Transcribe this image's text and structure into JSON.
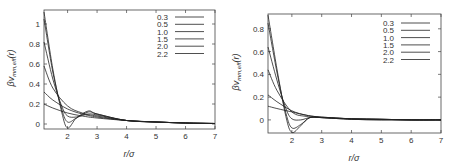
{
  "chart_data": [
    {
      "type": "line",
      "panel": "left",
      "title": "",
      "xlabel": "r/σ",
      "ylabel": "βv_mm,eff(r)",
      "xlim": [
        1.2,
        7
      ],
      "ylim": [
        -0.05,
        1.14
      ],
      "xticks": [
        2,
        3,
        4,
        5,
        6,
        7
      ],
      "yticks": [
        0,
        0.2,
        0.4,
        0.6,
        0.8,
        1
      ],
      "ytick_labels": [
        "0",
        "0.2",
        "0.4",
        "0.6",
        "0.8",
        "1"
      ],
      "grid": false,
      "legend_position": "upper right",
      "series": [
        {
          "name": "0.3",
          "x": [
            1.2,
            1.5,
            2.0,
            2.5,
            3.0,
            4.0,
            5.0,
            6.0,
            7.0
          ],
          "values": [
            0.2,
            0.16,
            0.11,
            0.08,
            0.06,
            0.035,
            0.02,
            0.01,
            0.005
          ]
        },
        {
          "name": "0.5",
          "x": [
            1.2,
            1.5,
            2.0,
            2.5,
            3.0,
            4.0,
            5.0,
            6.0,
            7.0
          ],
          "values": [
            0.32,
            0.24,
            0.15,
            0.1,
            0.07,
            0.035,
            0.02,
            0.01,
            0.005
          ]
        },
        {
          "name": "1.0",
          "x": [
            1.2,
            1.5,
            2.0,
            2.5,
            3.0,
            4.0,
            5.0,
            6.0,
            7.0
          ],
          "values": [
            0.58,
            0.36,
            0.18,
            0.11,
            0.08,
            0.035,
            0.02,
            0.01,
            0.005
          ]
        },
        {
          "name": "1.5",
          "x": [
            1.2,
            1.5,
            1.8,
            2.0,
            2.3,
            2.7,
            3.0,
            4.0,
            5.0,
            6.0,
            7.0
          ],
          "values": [
            0.82,
            0.45,
            0.18,
            0.08,
            0.07,
            0.1,
            0.09,
            0.035,
            0.02,
            0.01,
            0.005
          ]
        },
        {
          "name": "2.0",
          "x": [
            1.2,
            1.5,
            1.8,
            2.0,
            2.3,
            2.7,
            3.0,
            4.0,
            5.0,
            6.0,
            7.0
          ],
          "values": [
            1.05,
            0.52,
            0.15,
            0.02,
            0.06,
            0.12,
            0.1,
            0.035,
            0.02,
            0.01,
            0.005
          ]
        },
        {
          "name": "2.2",
          "x": [
            1.2,
            1.5,
            1.8,
            2.0,
            2.3,
            2.7,
            3.0,
            4.0,
            5.0,
            6.0,
            7.0
          ],
          "values": [
            1.12,
            0.55,
            0.12,
            -0.04,
            0.06,
            0.13,
            0.1,
            0.035,
            0.02,
            0.01,
            0.005
          ]
        }
      ]
    },
    {
      "type": "line",
      "panel": "right",
      "title": "",
      "xlabel": "r/σ",
      "ylabel": "βv_mm,eff(r)",
      "xlim": [
        1.2,
        7
      ],
      "ylim": [
        -0.115,
        0.93
      ],
      "xticks": [
        2,
        3,
        4,
        5,
        6,
        7
      ],
      "yticks": [
        0,
        0.2,
        0.4,
        0.6,
        0.8
      ],
      "ytick_labels": [
        "0",
        "0.2",
        "0.4",
        "0.6",
        "0.8"
      ],
      "grid": false,
      "legend_position": "upper right",
      "series": [
        {
          "name": "0.3",
          "x": [
            1.2,
            1.5,
            2.0,
            2.5,
            3.0,
            4.0,
            5.0,
            6.0,
            7.0
          ],
          "values": [
            0.12,
            0.1,
            0.07,
            0.04,
            0.025,
            0.01,
            0.005,
            0.0,
            0.0
          ]
        },
        {
          "name": "0.5",
          "x": [
            1.2,
            1.5,
            2.0,
            2.5,
            3.0,
            4.0,
            5.0,
            6.0,
            7.0
          ],
          "values": [
            0.22,
            0.16,
            0.08,
            0.04,
            0.025,
            0.01,
            0.005,
            0.0,
            0.0
          ]
        },
        {
          "name": "1.0",
          "x": [
            1.2,
            1.5,
            2.0,
            2.5,
            3.0,
            4.0,
            5.0,
            6.0,
            7.0
          ],
          "values": [
            0.44,
            0.26,
            0.07,
            0.03,
            0.02,
            0.01,
            0.005,
            0.0,
            0.0
          ]
        },
        {
          "name": "1.5",
          "x": [
            1.2,
            1.5,
            1.8,
            2.0,
            2.3,
            2.6,
            3.0,
            4.0,
            5.0,
            6.0,
            7.0
          ],
          "values": [
            0.64,
            0.35,
            0.1,
            0.01,
            0.0,
            0.02,
            0.02,
            0.01,
            0.005,
            0.0,
            0.0
          ]
        },
        {
          "name": "2.0",
          "x": [
            1.2,
            1.5,
            1.8,
            2.0,
            2.3,
            2.6,
            3.0,
            4.0,
            5.0,
            6.0,
            7.0
          ],
          "values": [
            0.85,
            0.42,
            0.06,
            -0.07,
            -0.04,
            0.02,
            0.02,
            0.005,
            0.0,
            0.0,
            0.0
          ]
        },
        {
          "name": "2.2",
          "x": [
            1.2,
            1.5,
            1.8,
            2.0,
            2.3,
            2.6,
            3.0,
            4.0,
            5.0,
            6.0,
            7.0
          ],
          "values": [
            0.92,
            0.45,
            0.03,
            -0.11,
            -0.05,
            0.02,
            0.02,
            0.005,
            0.0,
            0.0,
            0.0
          ]
        }
      ]
    }
  ],
  "panels": {
    "left": {
      "xlabel": "r/σ",
      "ylabel_main": "βv",
      "ylabel_sub": "mm,eff",
      "ylabel_tail": "(r)",
      "xticks": [
        "2",
        "3",
        "4",
        "5",
        "6",
        "7"
      ],
      "yticks": [
        "0",
        "0.2",
        "0.4",
        "0.6",
        "0.8",
        "1"
      ],
      "legend": [
        "0.3",
        "0.5",
        "1.0",
        "1.5",
        "2.0",
        "2.2"
      ]
    },
    "right": {
      "xlabel": "r/σ",
      "ylabel_main": "βv",
      "ylabel_sub": "mm,eff",
      "ylabel_tail": "(r)",
      "xticks": [
        "2",
        "3",
        "4",
        "5",
        "6",
        "7"
      ],
      "yticks": [
        "0",
        "0.2",
        "0.4",
        "0.6",
        "0.8"
      ],
      "legend": [
        "0.3",
        "0.5",
        "1.0",
        "1.5",
        "2.0",
        "2.2"
      ]
    }
  }
}
